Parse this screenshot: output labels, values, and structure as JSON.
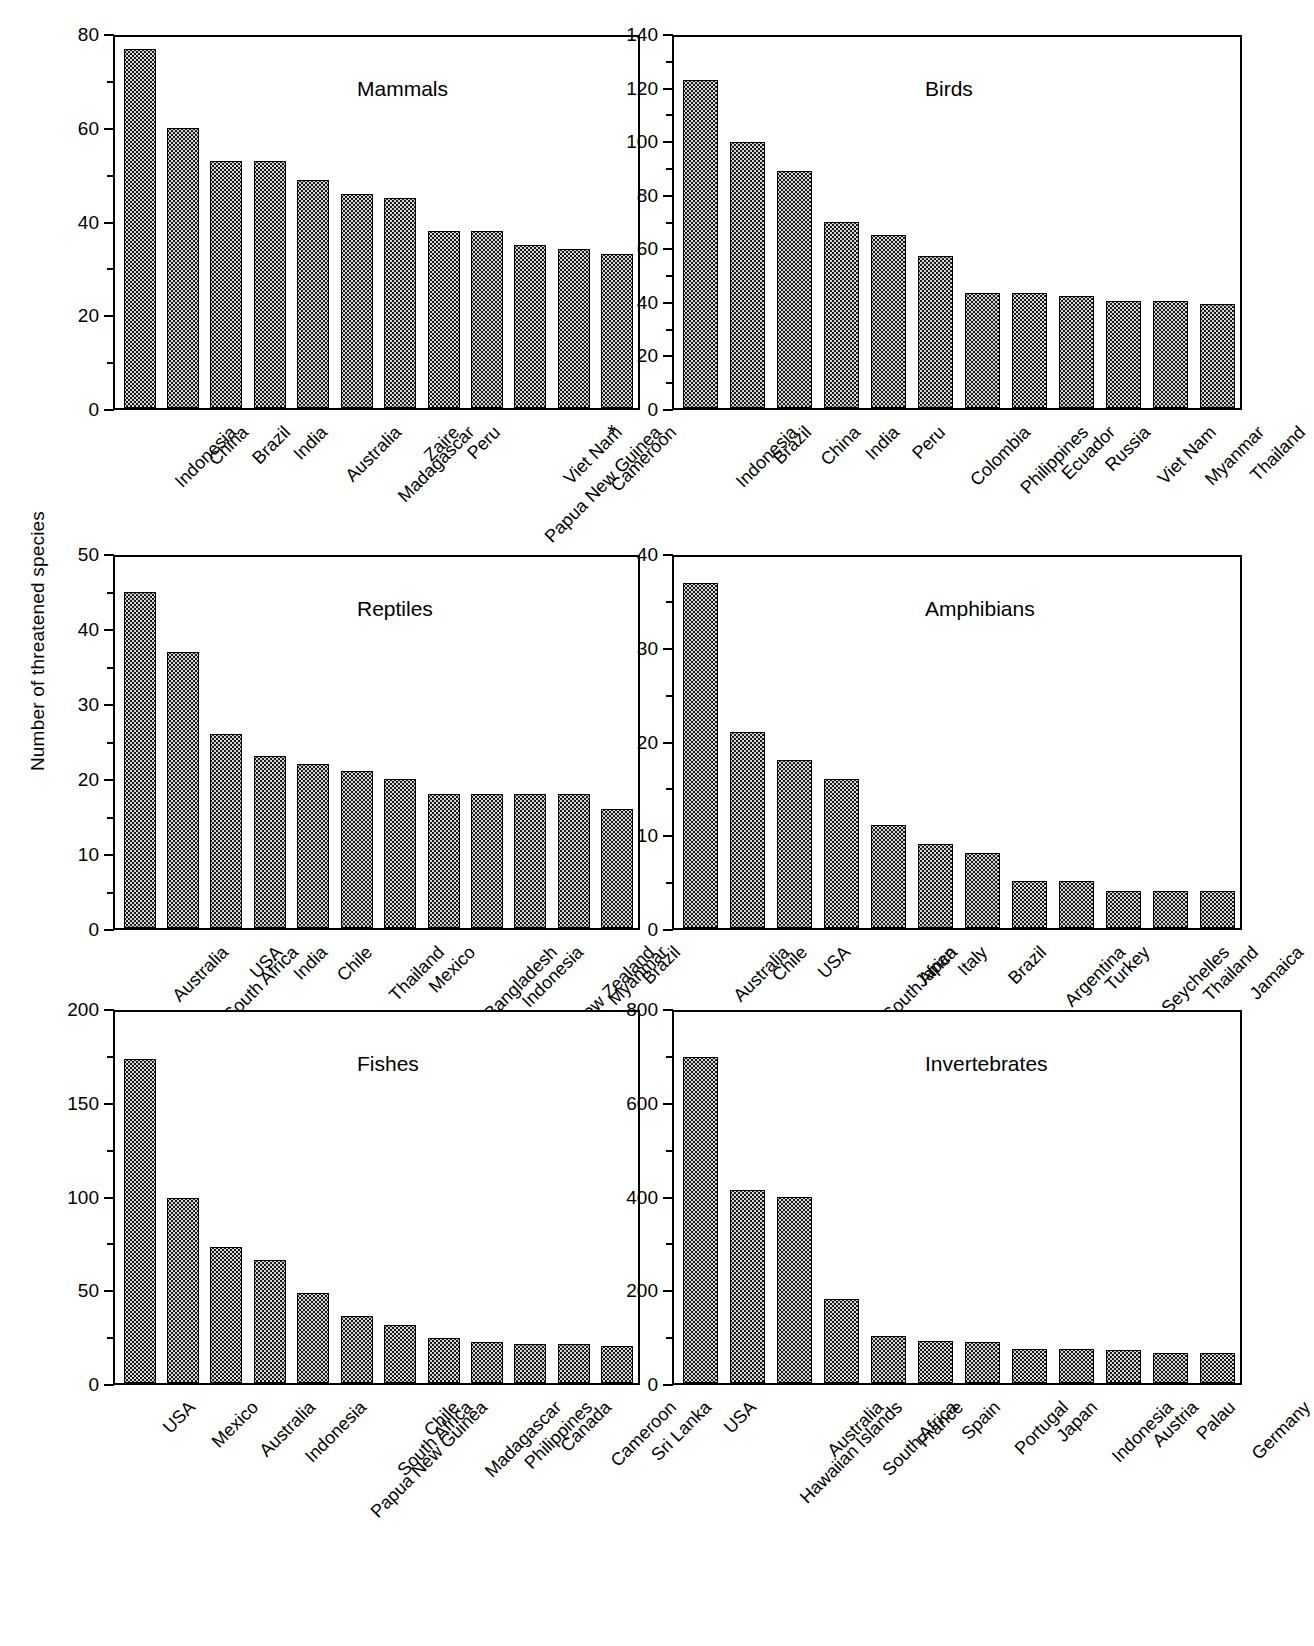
{
  "figure": {
    "y_axis_caption": "Number of threatened species"
  },
  "chart_data": [
    {
      "type": "bar",
      "title": "Mammals",
      "xlabel": "",
      "ylabel": "Number of threatened species",
      "ylim": [
        0,
        80
      ],
      "yticks": [
        0,
        20,
        40,
        60,
        80
      ],
      "grid": false,
      "categories": [
        "Indonesia",
        "China",
        "Brazil",
        "India",
        "Australia",
        "Madagascar",
        "Zaire",
        "Peru",
        "Papua New Guinea",
        "Viet Nam",
        "Cameroon",
        "*"
      ],
      "values": [
        77,
        60,
        53,
        53,
        49,
        46,
        45,
        38,
        38,
        35,
        34,
        33
      ]
    },
    {
      "type": "bar",
      "title": "Birds",
      "xlabel": "",
      "ylabel": "Number of threatened species",
      "ylim": [
        0,
        140
      ],
      "yticks": [
        0,
        20,
        40,
        60,
        80,
        100,
        120,
        140
      ],
      "grid": false,
      "categories": [
        "Indonesia",
        "Brazil",
        "China",
        "India",
        "Peru",
        "Colombia",
        "Philippines",
        "Ecuador",
        "Russia",
        "Viet Nam",
        "Myanmar",
        "Thailand"
      ],
      "values": [
        123,
        100,
        89,
        70,
        65,
        57,
        43,
        43,
        42,
        40,
        40,
        39
      ]
    },
    {
      "type": "bar",
      "title": "Reptiles",
      "xlabel": "",
      "ylabel": "Number of threatened species",
      "ylim": [
        0,
        50
      ],
      "yticks": [
        0,
        10,
        20,
        30,
        40,
        50
      ],
      "grid": false,
      "categories": [
        "Australia",
        "South Africa",
        "USA",
        "India",
        "Chile",
        "Thailand",
        "Mexico",
        "Bangladesh",
        "Indonesia",
        "New Zealand",
        "Myanmar",
        "Brazil"
      ],
      "values": [
        45,
        37,
        26,
        23,
        22,
        21,
        20,
        18,
        18,
        18,
        18,
        16
      ]
    },
    {
      "type": "bar",
      "title": "Amphibians",
      "xlabel": "",
      "ylabel": "Number of threatened species",
      "ylim": [
        0,
        40
      ],
      "yticks": [
        0,
        10,
        20,
        30,
        40
      ],
      "grid": false,
      "categories": [
        "Australia",
        "Chile",
        "USA",
        "South Africa",
        "Japan",
        "Italy",
        "Brazil",
        "Argentina",
        "Turkey",
        "Seychelles",
        "Thailand",
        "Jamaica"
      ],
      "values": [
        37,
        21,
        18,
        16,
        11,
        9,
        8,
        5,
        5,
        4,
        4,
        4
      ]
    },
    {
      "type": "bar",
      "title": "Fishes",
      "xlabel": "",
      "ylabel": "Number of threatened species",
      "ylim": [
        0,
        200
      ],
      "yticks": [
        0,
        50,
        100,
        150,
        200
      ],
      "grid": false,
      "categories": [
        "USA",
        "Mexico",
        "Australia",
        "Indonesia",
        "Papua New Guinea",
        "South Africa",
        "Chile",
        "Madagascar",
        "Philippines",
        "Canada",
        "Cameroon",
        "Sri Lanka"
      ],
      "values": [
        174,
        99,
        73,
        66,
        48,
        36,
        31,
        24,
        22,
        21,
        21,
        20
      ]
    },
    {
      "type": "bar",
      "title": "Invertebrates",
      "xlabel": "",
      "ylabel": "Number of threatened species",
      "ylim": [
        0,
        800
      ],
      "yticks": [
        0,
        200,
        400,
        600,
        800
      ],
      "grid": false,
      "categories": [
        "USA",
        "Hawaiian Islands",
        "Australia",
        "South Africa",
        "France",
        "Spain",
        "Portugal",
        "Japan",
        "Indonesia",
        "Austria",
        "Palau",
        "Germany"
      ],
      "values": [
        700,
        415,
        400,
        180,
        100,
        90,
        88,
        72,
        72,
        70,
        65,
        64
      ]
    }
  ]
}
